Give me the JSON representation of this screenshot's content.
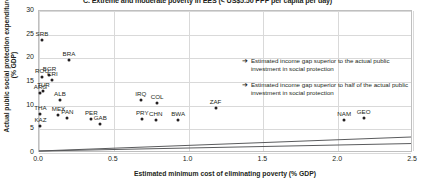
{
  "chart_data": {
    "type": "scatter",
    "title": "C. Extreme and moderate poverty in EES (< US$5.50 PPP per capita per day)",
    "xlabel": "Estimated minimum cost of eliminating poverty (% GDP)",
    "ylabel": "Actual public social protection expenditure (% GDP)",
    "xlim": [
      0.0,
      2.5
    ],
    "ylim": [
      0,
      30
    ],
    "xticks": [
      "0.0",
      "0.5",
      "1.0",
      "1.5",
      "2.0",
      "2.5"
    ],
    "yticks": [
      "0",
      "5",
      "10",
      "15",
      "20",
      "25",
      "30"
    ],
    "grid": true,
    "legend_position": "right-inside",
    "points": [
      {
        "label": "SRB",
        "x": 0.02,
        "y": 23.8
      },
      {
        "label": "BRA",
        "x": 0.2,
        "y": 19.6
      },
      {
        "label": "BGR",
        "x": 0.07,
        "y": 16.4
      },
      {
        "label": "ROU",
        "x": 0.02,
        "y": 16.0
      },
      {
        "label": "CRI",
        "x": 0.09,
        "y": 15.4
      },
      {
        "label": "TUR",
        "x": 0.03,
        "y": 13.1
      },
      {
        "label": "ARG",
        "x": 0.01,
        "y": 12.6
      },
      {
        "label": "ALB",
        "x": 0.14,
        "y": 11.3
      },
      {
        "label": "IRQ",
        "x": 0.68,
        "y": 11.2
      },
      {
        "label": "COL",
        "x": 0.79,
        "y": 10.6
      },
      {
        "label": "THA",
        "x": 0.01,
        "y": 8.2
      },
      {
        "label": "MEX",
        "x": 0.13,
        "y": 8.0
      },
      {
        "label": "PAN",
        "x": 0.19,
        "y": 7.4
      },
      {
        "label": "PER",
        "x": 0.35,
        "y": 7.2
      },
      {
        "label": "PRY",
        "x": 0.69,
        "y": 7.2
      },
      {
        "label": "CHN",
        "x": 0.78,
        "y": 6.9
      },
      {
        "label": "GAB",
        "x": 0.41,
        "y": 6.2
      },
      {
        "label": "KAZ",
        "x": 0.01,
        "y": 5.8
      },
      {
        "label": "BWA",
        "x": 0.93,
        "y": 7.0
      },
      {
        "label": "ZAF",
        "x": 1.18,
        "y": 9.6
      },
      {
        "label": "NAM",
        "x": 2.04,
        "y": 6.9
      },
      {
        "label": "GEO",
        "x": 2.17,
        "y": 7.3
      }
    ],
    "reference_lines": [
      {
        "name": "actual-investment-line",
        "x0": 0.0,
        "y0": 0.0,
        "x1": 2.5,
        "y1": 3.0
      },
      {
        "name": "half-investment-line",
        "x0": 0.0,
        "y0": 0.0,
        "x1": 2.5,
        "y1": 1.6
      }
    ]
  },
  "legend": {
    "arrow_glyph": "➔",
    "items": [
      {
        "text": "Estimated income gap superior to the actual public investment in social protection"
      },
      {
        "text": "Estimated income gap superior to half of the actual public investment in social protection"
      }
    ]
  }
}
